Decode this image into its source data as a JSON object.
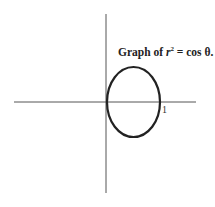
{
  "diagram": {
    "title_prefix": "Graph of ",
    "title_var": "r",
    "title_exp": "2",
    "title_suffix": " = cos θ.",
    "x_tick_label": "1",
    "colors": {
      "curve": "#222222",
      "axis": "#555555",
      "background": "#ffffff"
    },
    "curve": {
      "equation": "r^2 = cos θ",
      "x_range": [
        0,
        1
      ],
      "shape": "closed oval right of origin"
    }
  }
}
